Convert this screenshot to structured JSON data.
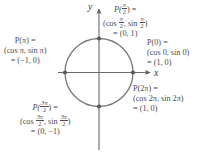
{
  "figure": {
    "type": "unit-circle-diagram",
    "axis_labels": {
      "x": "x",
      "y": "y"
    },
    "circle": {
      "center": [
        99,
        72.5
      ],
      "radius": 34
    },
    "points": [
      {
        "id": "half-pi",
        "angle": "π/2",
        "coords": [
          0,
          1
        ],
        "px": [
          99,
          38.5
        ]
      },
      {
        "id": "zero",
        "angle": "0",
        "coords": [
          1,
          0
        ],
        "px": [
          133,
          72.5
        ]
      },
      {
        "id": "pi",
        "angle": "π",
        "coords": [
          -1,
          0
        ],
        "px": [
          65,
          72.5
        ]
      },
      {
        "id": "three-half-pi",
        "angle": "3π/2",
        "coords": [
          0,
          -1
        ],
        "px": [
          99,
          106.5
        ]
      }
    ],
    "labels": {
      "half_pi": {
        "line1_p": "P(",
        "line1_num": "π",
        "line1_den": "2",
        "line1_end": ") =",
        "line2_open": "(cos ",
        "line2_num1": "π",
        "line2_den1": "2",
        "line2_mid": ", sin ",
        "line2_num2": "π",
        "line2_den2": "2",
        "line2_close": ")",
        "line3": "= (0, 1)"
      },
      "zero": {
        "line1": "P(0) =",
        "line2": "(cos 0, sin 0)",
        "line3": "= (1, 0)"
      },
      "two_pi": {
        "line1": "P(2π) =",
        "line2": "(cos 2π, sin 2π)",
        "line3": "= (1, 0)"
      },
      "pi": {
        "line1": "P(π) =",
        "line2": "(cos π, sin π)",
        "line3": "= (−1, 0)"
      },
      "three_half_pi": {
        "line1_p": "P(",
        "line1_num": "3π",
        "line1_den": "2",
        "line1_end": ") =",
        "line2_open": "(cos ",
        "line2_num1": "3π",
        "line2_den1": "2",
        "line2_mid": ", sin ",
        "line2_num2": "3π",
        "line2_den2": "2",
        "line2_close": ")",
        "line3": "= (0, −1)"
      }
    },
    "colors": {
      "stroke": "#6b6b6b",
      "text": "#4a4a4a",
      "background": "#ffffff"
    }
  }
}
